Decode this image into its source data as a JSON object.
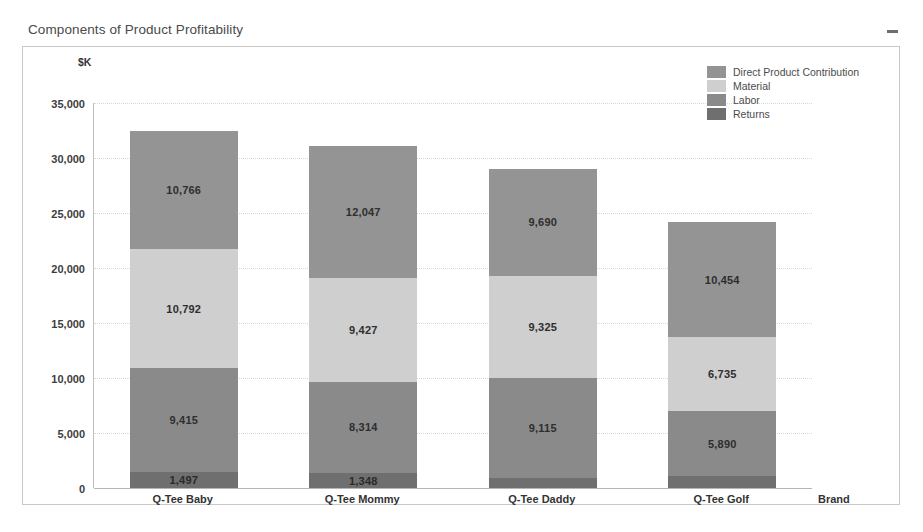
{
  "window": {
    "title": "Components of Product Profitability",
    "minimize_icon": "minimize-icon"
  },
  "chart_data": {
    "type": "bar",
    "subtype": "stacked-bar",
    "title": "Components of Product Profitability",
    "xlabel": "Brand",
    "ylabel": "$K",
    "ylim": [
      0,
      35000
    ],
    "ytick_labels": [
      "0",
      "5,000",
      "10,000",
      "15,000",
      "20,000",
      "25,000",
      "30,000",
      "35,000"
    ],
    "ytick_values": [
      0,
      5000,
      10000,
      15000,
      20000,
      25000,
      30000,
      35000
    ],
    "grid": true,
    "legend_position": "top-right",
    "categories": [
      "Q-Tee Baby",
      "Q-Tee Mommy",
      "Q-Tee Daddy",
      "Q-Tee Golf"
    ],
    "series": [
      {
        "name": "Returns",
        "color": "#6f6f6f",
        "values": [
          1497,
          1348,
          880,
          1080
        ],
        "labels": [
          "1,497",
          "1,348",
          "",
          ""
        ]
      },
      {
        "name": "Labor",
        "color": "#8a8a8a",
        "values": [
          9415,
          8314,
          9115,
          5890
        ],
        "labels": [
          "9,415",
          "8,314",
          "9,115",
          "5,890"
        ]
      },
      {
        "name": "Material",
        "color": "#cfcfcf",
        "values": [
          10792,
          9427,
          9325,
          6735
        ],
        "labels": [
          "10,792",
          "9,427",
          "9,325",
          "6,735"
        ]
      },
      {
        "name": "Direct Product Contribution",
        "color": "#949494",
        "values": [
          10766,
          12047,
          9690,
          10454
        ],
        "labels": [
          "10,766",
          "12,047",
          "9,690",
          "10,454"
        ]
      }
    ],
    "totals": [
      32470,
      31136,
      29010,
      24159
    ]
  },
  "legend": {
    "items": [
      {
        "label": "Direct Product Contribution",
        "color": "#949494"
      },
      {
        "label": "Material",
        "color": "#cfcfcf"
      },
      {
        "label": "Labor",
        "color": "#8a8a8a"
      },
      {
        "label": "Returns",
        "color": "#6f6f6f"
      }
    ]
  }
}
